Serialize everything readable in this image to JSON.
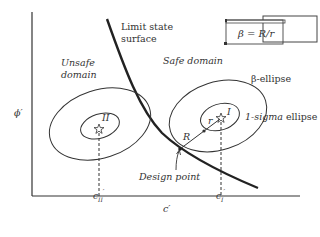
{
  "diagram": {
    "labels": {
      "limit_state_line1": "Limit state",
      "limit_state_line2": "surface",
      "unsafe_line1": "Unsafe",
      "unsafe_line2": "domain",
      "safe_domain": "Safe domain",
      "beta_ellipse": "β-ellipse",
      "one_sigma_italic": "1-sigma",
      "one_sigma_rest": " ellipse",
      "point_I": "I",
      "point_II": "II",
      "R": "R",
      "r": "r",
      "design_point": "Design point",
      "y_axis": "ϕ′",
      "x_axis": "c′",
      "c_II_base": "c",
      "c_II_sub": "II",
      "c_I_base": "c",
      "c_I_sub": "I",
      "prime": "′",
      "formula": "β = R/r"
    },
    "colors": {
      "line": "#333333",
      "curve": "#222222",
      "background": "#ffffff"
    }
  }
}
